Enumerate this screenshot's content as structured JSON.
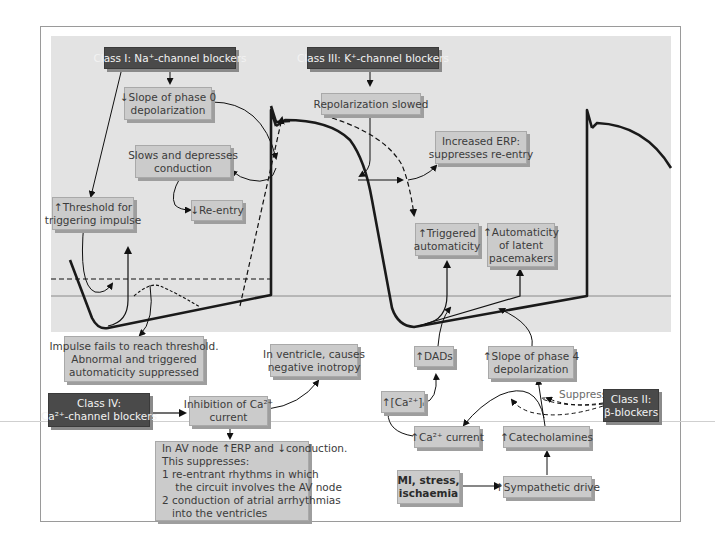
{
  "diagram": {
    "drug_classes": {
      "class1": "Class I: Na⁺-channel blockers",
      "class2_line1": "Class II:",
      "class2_line2": "β-blockers",
      "class3": "Class III: K⁺-channel blockers",
      "class4_line1": "Class IV:",
      "class4_line2": "Ca²⁺-channel blockers"
    },
    "effects": {
      "slope_phase0_line1": "↓Slope of phase 0",
      "slope_phase0_line2": "depolarization",
      "slows_conduction_line1": "Slows and depresses",
      "slows_conduction_line2": "conduction",
      "reentry_down": "↓Re-entry",
      "threshold_line1": "↑Threshold for",
      "threshold_line2": "triggering impulse",
      "repolarization": "Repolarization slowed",
      "erp_line1": "Increased ERP:",
      "erp_line2": "suppresses re-entry",
      "triggered_line1": "↑Triggered",
      "triggered_line2": "automaticity",
      "latent_line1": "↑Automaticity",
      "latent_line2": "of latent",
      "latent_line3": "pacemakers",
      "impulse_fails_line1": "Impulse fails to reach threshold.",
      "impulse_fails_line2": "Abnormal and triggered",
      "impulse_fails_line3": "automaticity suppressed",
      "ventricle_line1": "In ventricle, causes",
      "ventricle_line2": "negative inotropy",
      "inhibition_line1": "Inhibition of Ca²⁺",
      "inhibition_line2": "current",
      "av_node_line1": "In AV node ↑ERP and ↓conduction.",
      "av_node_line2": "This suppresses:",
      "av_node_line3": "1  re-entrant rhythms in which",
      "av_node_line4": "    the circuit involves the AV node",
      "av_node_line5": "2 conduction of atrial arrhythmias",
      "av_node_line6": "   into the ventricles",
      "dads": "↑DADs",
      "ca_i": "↑[Ca²⁺]ᵢ",
      "slope_phase4_line1": "↑Slope of phase 4",
      "slope_phase4_line2": "depolarization",
      "suppress": "Suppress",
      "ca_current": "↑Ca²⁺ current",
      "catecholamines": "↑Catecholamines",
      "mi_line1": "MI, stress,",
      "mi_line2": "ischaemia",
      "sympathetic": "↑Sympathetic drive"
    },
    "colors": {
      "panel_bg": "#e3e3e3",
      "box_bg": "#cbcbcb",
      "dark_box_bg": "#4a4a4a",
      "curve": "#1a1a1a"
    }
  }
}
